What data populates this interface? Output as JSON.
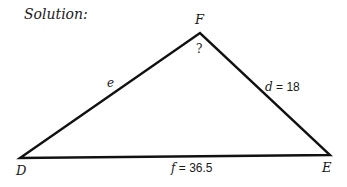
{
  "title": "Solution:",
  "triangle": {
    "vertices": {
      "D": {
        "label": "D"
      },
      "E": {
        "label": "E"
      },
      "F": {
        "label": "F"
      }
    },
    "sides": {
      "e": {
        "var": "e",
        "value": ""
      },
      "d": {
        "var": "d",
        "equals": " = ",
        "value": "18"
      },
      "f": {
        "var": "f",
        "equals": " = ",
        "value": "36.5"
      }
    },
    "angle_F_label": "?"
  }
}
